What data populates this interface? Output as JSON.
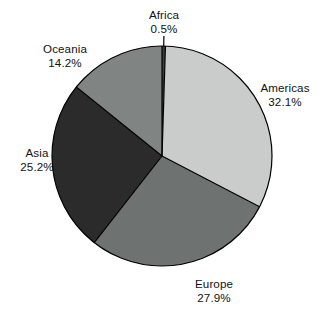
{
  "chart_data": {
    "type": "pie",
    "title": "",
    "subtitle": "",
    "xlabel": "",
    "ylabel": "",
    "legend_position": "none",
    "grid": false,
    "label_format": "name + percent",
    "start_angle_deg": 0,
    "direction": "clockwise",
    "units": "percent",
    "categories": [
      "Africa",
      "Americas",
      "Europe",
      "Asia",
      "Oceania"
    ],
    "values": [
      0.5,
      32.1,
      27.9,
      25.2,
      14.2
    ],
    "value_labels": [
      "0.5%",
      "32.1%",
      "27.9%",
      "25.2%",
      "14.2%"
    ],
    "slices": [
      {
        "name": "Africa",
        "value": 0.5,
        "value_label": "0.5%",
        "color": "#3a3d3c",
        "label_position": "top"
      },
      {
        "name": "Americas",
        "value": 32.1,
        "value_label": "32.1%",
        "color": "#c9cccb",
        "label_position": "right"
      },
      {
        "name": "Europe",
        "value": 27.9,
        "value_label": "27.9%",
        "color": "#6e7271",
        "label_position": "bottom"
      },
      {
        "name": "Asia",
        "value": 25.2,
        "value_label": "25.2%",
        "color": "#2b2b2b",
        "label_position": "left"
      },
      {
        "name": "Oceania",
        "value": 14.2,
        "value_label": "14.2%",
        "color": "#808483",
        "label_position": "top-left"
      }
    ],
    "geometry": {
      "center_x": 162,
      "center_y": 156,
      "radius": 110,
      "outline_color": "#000000",
      "outline_width": 1.2,
      "separator_color": "#000000",
      "background": "#ffffff"
    }
  }
}
